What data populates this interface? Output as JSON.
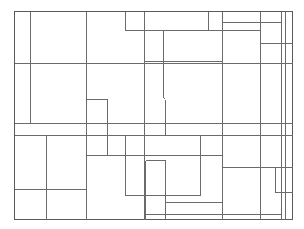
{
  "diagram": {
    "type": "rectangle-partition",
    "stroke_color": "#6b6b6b",
    "frame": {
      "x": 14,
      "y": 11,
      "w": 278,
      "h": 208
    },
    "lines": [
      {
        "x1": 30,
        "y1": 11,
        "x2": 30,
        "y2": 123
      },
      {
        "x1": 86,
        "y1": 11,
        "x2": 86,
        "y2": 219
      },
      {
        "x1": 125,
        "y1": 11,
        "x2": 125,
        "y2": 30
      },
      {
        "x1": 144,
        "y1": 11,
        "x2": 144,
        "y2": 219
      },
      {
        "x1": 208,
        "y1": 11,
        "x2": 208,
        "y2": 30
      },
      {
        "x1": 222,
        "y1": 11,
        "x2": 222,
        "y2": 219
      },
      {
        "x1": 260,
        "y1": 11,
        "x2": 260,
        "y2": 219
      },
      {
        "x1": 281,
        "y1": 11,
        "x2": 281,
        "y2": 219
      },
      {
        "x1": 285,
        "y1": 11,
        "x2": 285,
        "y2": 219
      },
      {
        "x1": 125,
        "y1": 30,
        "x2": 260,
        "y2": 30
      },
      {
        "x1": 222,
        "y1": 22,
        "x2": 281,
        "y2": 22
      },
      {
        "x1": 260,
        "y1": 43,
        "x2": 292,
        "y2": 43
      },
      {
        "x1": 144,
        "y1": 61,
        "x2": 222,
        "y2": 61
      },
      {
        "x1": 14,
        "y1": 63,
        "x2": 292,
        "y2": 63
      },
      {
        "x1": 163,
        "y1": 30,
        "x2": 163,
        "y2": 97
      },
      {
        "x1": 163,
        "y1": 97,
        "x2": 165,
        "y2": 99
      },
      {
        "x1": 165,
        "y1": 99,
        "x2": 165,
        "y2": 134
      },
      {
        "x1": 86,
        "y1": 99,
        "x2": 107,
        "y2": 99
      },
      {
        "x1": 107,
        "y1": 99,
        "x2": 107,
        "y2": 155
      },
      {
        "x1": 14,
        "y1": 123,
        "x2": 292,
        "y2": 123
      },
      {
        "x1": 14,
        "y1": 135,
        "x2": 292,
        "y2": 135
      },
      {
        "x1": 46,
        "y1": 135,
        "x2": 46,
        "y2": 219
      },
      {
        "x1": 14,
        "y1": 189,
        "x2": 86,
        "y2": 189
      },
      {
        "x1": 125,
        "y1": 135,
        "x2": 125,
        "y2": 195
      },
      {
        "x1": 86,
        "y1": 155,
        "x2": 222,
        "y2": 155
      },
      {
        "x1": 125,
        "y1": 195,
        "x2": 200,
        "y2": 195
      },
      {
        "x1": 200,
        "y1": 135,
        "x2": 200,
        "y2": 195
      },
      {
        "x1": 145,
        "y1": 160,
        "x2": 165,
        "y2": 160
      },
      {
        "x1": 165,
        "y1": 160,
        "x2": 165,
        "y2": 219
      },
      {
        "x1": 145,
        "y1": 160,
        "x2": 145,
        "y2": 219
      },
      {
        "x1": 222,
        "y1": 167,
        "x2": 292,
        "y2": 167
      },
      {
        "x1": 275,
        "y1": 167,
        "x2": 275,
        "y2": 192
      },
      {
        "x1": 275,
        "y1": 192,
        "x2": 292,
        "y2": 192
      },
      {
        "x1": 165,
        "y1": 202,
        "x2": 222,
        "y2": 202
      },
      {
        "x1": 145,
        "y1": 214,
        "x2": 281,
        "y2": 214
      }
    ]
  }
}
